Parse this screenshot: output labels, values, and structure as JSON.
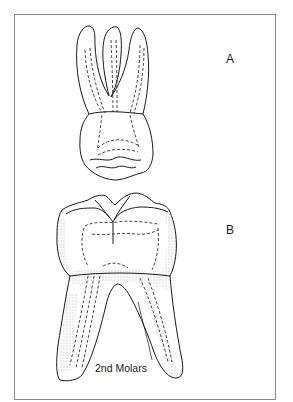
{
  "figure": {
    "labels": {
      "a": "A",
      "b": "B"
    },
    "caption": "2nd Molars",
    "colors": {
      "line": "#1a1a1a",
      "frame": "#8a8a8a",
      "background": "#ffffff"
    }
  }
}
